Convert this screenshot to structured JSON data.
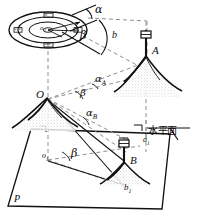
{
  "figure": {
    "background_color": "#ffffff",
    "ink_color": "#111111",
    "dash_color": "#8a8a8a",
    "width": 198,
    "height": 221
  },
  "labels": {
    "alpha": "α",
    "beta": "β",
    "beta_prime": "β′",
    "alpha_A": "α",
    "alpha_A_sub": "A",
    "alpha_B": "α",
    "alpha_B_sub": "B",
    "b": "b",
    "b1": "b",
    "b1_sub": "1",
    "a1": "a",
    "a1_sub": "1",
    "o1": "o",
    "o1_sub": "1",
    "o2": "o",
    "o2_sub": "2",
    "point_O": "O",
    "point_A": "A",
    "point_B": "B",
    "plane_P": "P",
    "horizontal_plane": "水平面"
  },
  "compass": {
    "name": "horizontal-circle-dial",
    "center_label": "o",
    "center_sub": "2",
    "graduations": [
      "0",
      "90",
      "180",
      "270"
    ]
  },
  "elements": {
    "peak_O": "mountain-peak-o",
    "peak_A": "mountain-peak-a",
    "peak_B": "mountain-peak-b",
    "target_A": "survey-target-a",
    "target_B": "survey-target-b",
    "ground_plane": "ground-plane-p"
  }
}
